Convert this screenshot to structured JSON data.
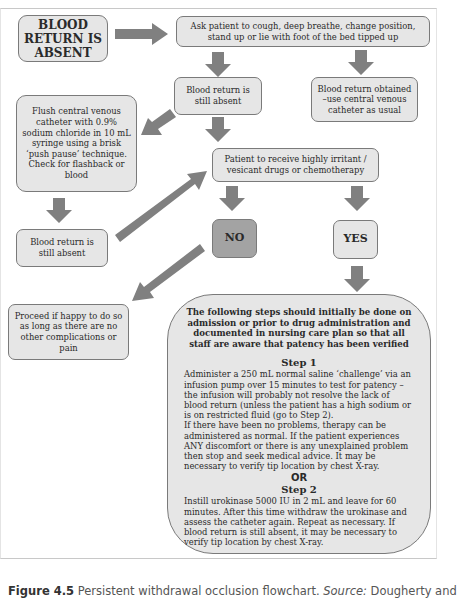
{
  "flowchart": {
    "start": "BLOOD RETURN IS ABSENT",
    "ask_patient": "Ask patient to cough, deep breathe, change position, stand up or lie with foot of the bed tipped up",
    "still_absent_1": "Blood return is still absent",
    "obtained": "Blood return obtained –use central venous catheter as usual",
    "flush": "Flush central venous catheter with 0.9% sodium chloride in 10 mL syringe using a brisk ‘push pause’ technique. Check for flashback or blood",
    "still_absent_2": "Blood return is still absent",
    "question": "Patient to receive highly irritant / vesicant drugs or chemotherapy",
    "no": "NO",
    "yes": "YES",
    "proceed": "Proceed if happy to do so as long as there are no other complications or pain",
    "steps_box": {
      "intro": "The following steps should initially be done on admission or prior to drug administration and documented in nursing care plan so that all staff are aware that patency has been verified",
      "step1_title": "Step 1",
      "step1_body": "Administer a 250 mL normal saline ‘challenge’ via an infusion pump over 15 minutes to test for patency – the infusion will probably not resolve the lack of blood return (unless the patient has a high sodium or is on restricted fluid (go to Step 2).",
      "step1_body2": "If there have been no problems, therapy can be administered as normal. If the patient experiences ANY discomfort or there is any unexplained problem then stop and seek medical advice. It may be necessary to verify tip location by chest X-ray.",
      "or": "OR",
      "step2_title": "Step 2",
      "step2_body": "Instill urokinase 5000 IU in 2 mL and leave for 60 minutes. After this time withdraw the urokinase and assess the catheter again. Repeat as necessary. If blood return is still absent, it may be necessary to verify tip location by chest X-ray."
    }
  },
  "caption": {
    "label": "Figure 4.5",
    "text": " Persistent withdrawal occlusion flowchart. ",
    "source_label": "Source:",
    "source_text": " Dougherty and"
  },
  "colors": {
    "box_fill": "#e6e6e6",
    "no_fill": "#a3a3a3",
    "arrow": "#7f7f7f",
    "border": "#7a7a7a"
  }
}
